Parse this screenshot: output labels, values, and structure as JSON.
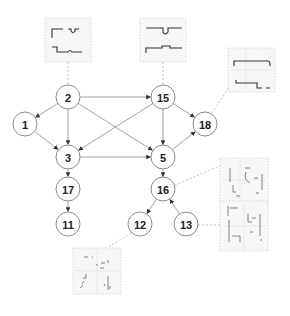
{
  "diagram": {
    "type": "directed-graph",
    "nodes": [
      {
        "id": "2",
        "label": "2",
        "x": 68,
        "y": 97
      },
      {
        "id": "15",
        "label": "15",
        "x": 163,
        "y": 97
      },
      {
        "id": "1",
        "label": "1",
        "x": 25,
        "y": 124
      },
      {
        "id": "18",
        "label": "18",
        "x": 205,
        "y": 124
      },
      {
        "id": "3",
        "label": "3",
        "x": 68,
        "y": 157
      },
      {
        "id": "5",
        "label": "5",
        "x": 163,
        "y": 157
      },
      {
        "id": "17",
        "label": "17",
        "x": 68,
        "y": 189
      },
      {
        "id": "16",
        "label": "16",
        "x": 163,
        "y": 189
      },
      {
        "id": "11",
        "label": "11",
        "x": 68,
        "y": 224
      },
      {
        "id": "12",
        "label": "12",
        "x": 140,
        "y": 224
      },
      {
        "id": "13",
        "label": "13",
        "x": 186,
        "y": 224
      }
    ],
    "edges": [
      {
        "from": "2",
        "to": "1"
      },
      {
        "from": "2",
        "to": "3"
      },
      {
        "from": "2",
        "to": "15"
      },
      {
        "from": "2",
        "to": "5"
      },
      {
        "from": "1",
        "to": "3"
      },
      {
        "from": "15",
        "to": "3"
      },
      {
        "from": "15",
        "to": "5"
      },
      {
        "from": "15",
        "to": "18"
      },
      {
        "from": "3",
        "to": "5"
      },
      {
        "from": "3",
        "to": "17"
      },
      {
        "from": "5",
        "to": "18"
      },
      {
        "from": "5",
        "to": "16"
      },
      {
        "from": "17",
        "to": "11"
      },
      {
        "from": "16",
        "to": "12"
      },
      {
        "from": "13",
        "to": "16"
      }
    ],
    "thumbnails": [
      {
        "attached_to": "2",
        "kind": "waveform",
        "x": 45,
        "y": 18,
        "w": 46,
        "h": 44
      },
      {
        "attached_to": "15",
        "kind": "waveform",
        "x": 140,
        "y": 18,
        "w": 46,
        "h": 44
      },
      {
        "attached_to": "18",
        "kind": "waveform",
        "x": 228,
        "y": 48,
        "w": 47,
        "h": 44
      },
      {
        "attached_to": "16",
        "kind": "scatter",
        "x": 220,
        "y": 158,
        "w": 48,
        "h": 46
      },
      {
        "attached_to": "13",
        "kind": "scatter",
        "x": 220,
        "y": 201,
        "w": 48,
        "h": 50
      },
      {
        "attached_to": "12",
        "kind": "scatter",
        "x": 73,
        "y": 248,
        "w": 48,
        "h": 46
      }
    ],
    "colors": {
      "node_stroke": "#8a8a8a",
      "edge": "#8c8c8c",
      "dashed_link": "#b0b0b0",
      "label": "#222222"
    }
  }
}
